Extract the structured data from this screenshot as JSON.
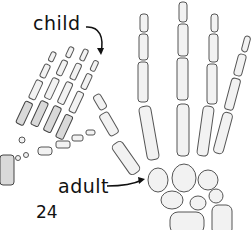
{
  "figure": {
    "labels": {
      "child": "child",
      "adult": "adult",
      "page_number": "24"
    },
    "subjects": [
      "child hand skeleton",
      "adult hand skeleton"
    ],
    "colors": {
      "background": "#ffffff",
      "bone_fill": "#f2f2f2",
      "bone_outline": "#555555",
      "text": "#111111"
    }
  }
}
